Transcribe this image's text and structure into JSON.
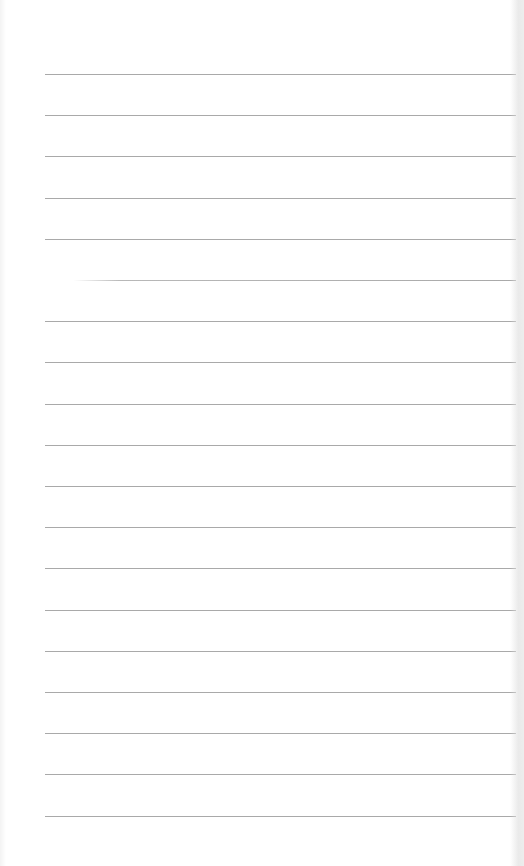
{
  "page": {
    "type": "ruled-notepad-page",
    "background_color": "#ffffff",
    "rule_color": "#a9a9a9",
    "rule_count": 19,
    "first_rule_y": 74,
    "rule_spacing": 41.2,
    "rule_left": 45,
    "rule_right": 516
  }
}
